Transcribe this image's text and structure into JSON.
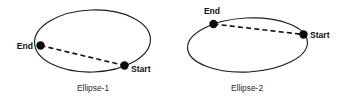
{
  "figure": {
    "background_color": "#ffffff",
    "stroke_color": "#1c1c1c",
    "dot_color": "#0d0d0d",
    "text_color": "#111111",
    "caption_color": "#2b2b2b"
  },
  "panels": [
    {
      "id": "ellipse-1",
      "caption": "Ellipse-1",
      "caption_x": 93,
      "caption_y": 91,
      "ellipse": {
        "cx": 92.5,
        "cy": 41,
        "rx": 58,
        "ry": 31,
        "rotation": -2
      },
      "chord": {
        "x1": 40.5,
        "y1": 45.5,
        "x2": 124.5,
        "y2": 65.5
      },
      "points": [
        {
          "name": "End",
          "label": "End",
          "cx": 40.5,
          "cy": 45.5,
          "r": 4.2,
          "label_x": 33,
          "label_y": 48.5,
          "anchor": "end"
        },
        {
          "name": "Start",
          "label": "Start",
          "cx": 124.5,
          "cy": 65.5,
          "r": 4.2,
          "label_x": 131,
          "label_y": 71.5,
          "anchor": "start"
        }
      ]
    },
    {
      "id": "ellipse-2",
      "caption": "Ellipse-2",
      "caption_x": 247,
      "caption_y": 91,
      "ellipse": {
        "cx": 247.5,
        "cy": 45,
        "rx": 60,
        "ry": 27,
        "rotation": -3
      },
      "chord": {
        "x1": 213.5,
        "y1": 24,
        "x2": 303.5,
        "y2": 34.5
      },
      "points": [
        {
          "name": "End",
          "label": "End",
          "cx": 213.5,
          "cy": 24,
          "r": 4.2,
          "label_x": 212,
          "label_y": 14,
          "anchor": "middle"
        },
        {
          "name": "Start",
          "label": "Start",
          "cx": 303.5,
          "cy": 34.5,
          "r": 4.2,
          "label_x": 310,
          "label_y": 37.5,
          "anchor": "start"
        }
      ]
    }
  ]
}
